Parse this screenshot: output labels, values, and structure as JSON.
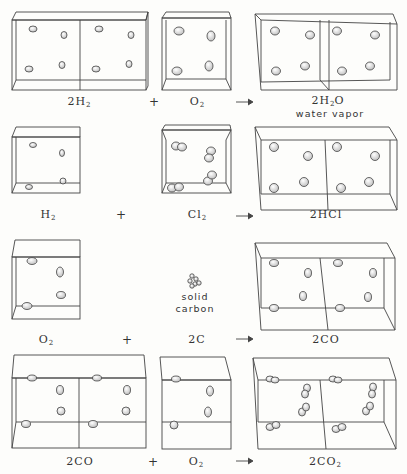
{
  "reactions": [
    {
      "reactants": [
        {
          "coef": "2",
          "formula": "H",
          "sub": "2",
          "label": "2H₂"
        },
        {
          "coef": "",
          "formula": "O",
          "sub": "2",
          "label": "O₂"
        }
      ],
      "product": {
        "coef": "2",
        "formula": "H",
        "sub": "2",
        "tail": "O",
        "label": "2H₂O",
        "note": "water vapor"
      }
    },
    {
      "reactants": [
        {
          "coef": "",
          "formula": "H",
          "sub": "2",
          "label": "H₂"
        },
        {
          "coef": "",
          "formula": "Cl",
          "sub": "2",
          "label": "Cl₂"
        }
      ],
      "product": {
        "coef": "2",
        "formula": "HCl",
        "sub": "",
        "tail": "",
        "label": "2HCl"
      }
    },
    {
      "reactants": [
        {
          "coef": "",
          "formula": "O",
          "sub": "2",
          "label": "O₂"
        },
        {
          "coef": "2",
          "formula": "C",
          "sub": "",
          "label": "2C",
          "note_line1": "solid",
          "note_line2": "carbon"
        }
      ],
      "product": {
        "coef": "2",
        "formula": "CO",
        "sub": "",
        "tail": "",
        "label": "2CO"
      }
    },
    {
      "reactants": [
        {
          "coef": "2",
          "formula": "CO",
          "sub": "",
          "label": "2CO"
        },
        {
          "coef": "",
          "formula": "O",
          "sub": "2",
          "label": "O₂"
        }
      ],
      "product": {
        "coef": "2",
        "formula": "CO",
        "sub": "2",
        "tail": "",
        "label": "2CO₂"
      }
    }
  ],
  "operators": {
    "plus": "+",
    "arrow": "→"
  },
  "colors": {
    "line": "#444444",
    "molecule_fill": "#e6e6e6",
    "background": "#fdfdfb"
  }
}
